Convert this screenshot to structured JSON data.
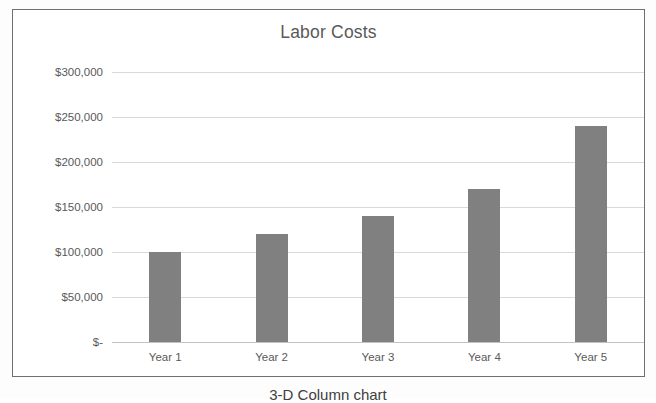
{
  "caption": "3-D Column chart",
  "chart": {
    "title": "Labor Costs"
  },
  "chart_data": {
    "type": "bar",
    "title": "Labor Costs",
    "xlabel": "",
    "ylabel": "",
    "categories": [
      "Year 1",
      "Year 2",
      "Year 3",
      "Year 4",
      "Year 5"
    ],
    "values": [
      100000,
      120000,
      140000,
      170000,
      240000
    ],
    "value_labels": [
      "$100,000",
      "$120,000",
      "$140,000",
      "$170,000",
      "$240,000"
    ],
    "ylim": [
      0,
      300000
    ],
    "ytick_values": [
      300000,
      250000,
      200000,
      150000,
      100000,
      50000,
      0
    ],
    "ytick_labels": [
      "$300,000",
      "$250,000",
      "$200,000",
      "$150,000",
      "$100,000",
      "$50,000",
      "$-"
    ],
    "grid": true,
    "legend": false,
    "legend_position": "none",
    "series": [
      {
        "name": "Labor Costs",
        "values": [
          100000,
          120000,
          140000,
          170000,
          240000
        ]
      }
    ],
    "colors": {
      "bar": "#808080",
      "gridline": "#d9d9d9",
      "axis_text": "#595959",
      "title_text": "#595959",
      "plot_background": "#ffffff",
      "frame_border": "#6f6f6f"
    }
  }
}
